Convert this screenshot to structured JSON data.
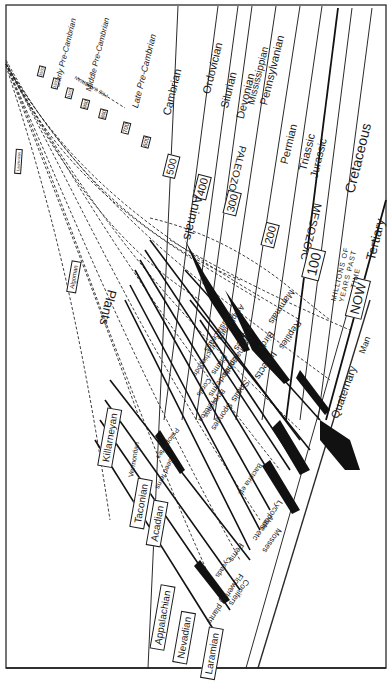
{
  "figure": {
    "colors": {
      "ink": "#1a1a1a",
      "paper": "#ffffff",
      "frame": "#3a3a3a"
    }
  },
  "precambrian": {
    "labels": [
      "Early Pre-Cambrian",
      "Middle Pre-Cambrian",
      "Late Pre-Cambrian"
    ],
    "era_label": "PRE CAMBRIAN",
    "tick_values": [
      "1500",
      "1300",
      "1100",
      "900",
      "800",
      "750",
      "700",
      "600"
    ]
  },
  "periods": [
    "Cambrian",
    "Ordovician",
    "Silurian",
    "Devonian",
    "Mississippian",
    "Pennsylvanian",
    "Permian",
    "Triassic",
    "Jurassic",
    "Cretaceous",
    "Tertiary",
    "Quaternary"
  ],
  "eras": {
    "paleozoic": "PALEOZOIC",
    "mesozoic": "MESOZOIC"
  },
  "time_markers": [
    "500",
    "400",
    "300",
    "200",
    "100",
    "NOW"
  ],
  "time_axis_label": "MILLIONS OF YEARS PAST TIME",
  "branches": {
    "animals": "Animals",
    "plants": "Plants"
  },
  "animal_groups": [
    "Mammals",
    "Birds",
    "Reptiles",
    "Amphibians",
    "Fishes",
    "Insects",
    "Crustaceans",
    "Cephalopods",
    "Clams",
    "Echinoderms",
    "Snails",
    "Brachiopods",
    "Corals",
    "Bryozoans",
    "Sponges",
    "Protozoa"
  ],
  "plant_groups": [
    "Psilophytes",
    "Seed ferns",
    "Algae",
    "Bacteria etc",
    "Mosses",
    "Lycopods etc",
    "Ferns",
    "Cycads",
    "Conifers",
    "Flowering plants"
  ],
  "man_label": "Man",
  "orogenies": [
    "Laurentian",
    "Algoman",
    "Killarneyan",
    "Vermontian",
    "Taconian",
    "Acadian",
    "Appalachian",
    "Nevadian",
    "Laramian"
  ]
}
